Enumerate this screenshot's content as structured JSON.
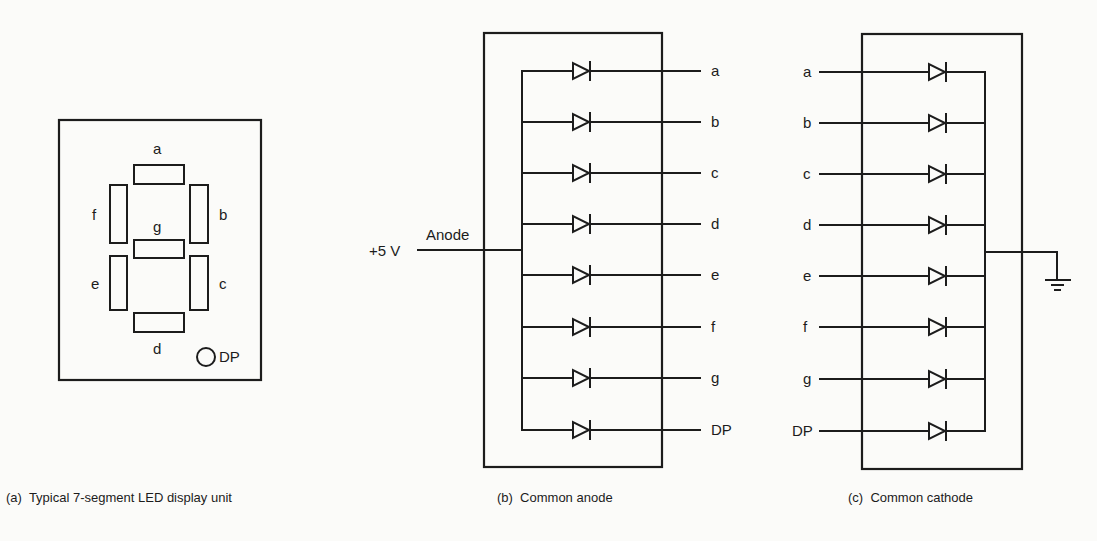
{
  "figure": {
    "panel_a": {
      "caption": "(a)  Typical 7-segment LED display unit",
      "segments": [
        {
          "id": "a",
          "label": "a"
        },
        {
          "id": "b",
          "label": "b"
        },
        {
          "id": "c",
          "label": "c"
        },
        {
          "id": "d",
          "label": "d"
        },
        {
          "id": "e",
          "label": "e"
        },
        {
          "id": "f",
          "label": "f"
        },
        {
          "id": "g",
          "label": "g"
        }
      ],
      "dp_label": "DP"
    },
    "panel_b": {
      "caption": "(b)  Common anode",
      "supply_label": "+5 V",
      "anode_label": "Anode",
      "outputs": [
        "a",
        "b",
        "c",
        "d",
        "e",
        "f",
        "g",
        "DP"
      ]
    },
    "panel_c": {
      "caption": "(c)  Common cathode",
      "inputs": [
        "a",
        "b",
        "c",
        "d",
        "e",
        "f",
        "g",
        "DP"
      ],
      "ground_symbol": "ground-icon"
    }
  },
  "colors": {
    "ink": "#1c1c1c",
    "paper": "#fbfbf9"
  }
}
